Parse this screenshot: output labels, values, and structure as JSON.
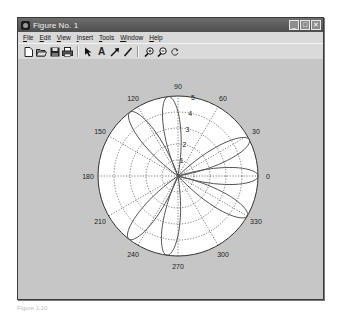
{
  "window": {
    "title": "Figure No. 1",
    "controls": {
      "minimize": "_",
      "maximize": "□",
      "close": "✕"
    }
  },
  "menubar": {
    "items": [
      {
        "label": "File",
        "underline": "F"
      },
      {
        "label": "Edit",
        "underline": "E"
      },
      {
        "label": "View",
        "underline": "V"
      },
      {
        "label": "Insert",
        "underline": "I"
      },
      {
        "label": "Tools",
        "underline": "T"
      },
      {
        "label": "Window",
        "underline": "W"
      },
      {
        "label": "Help",
        "underline": "H"
      }
    ]
  },
  "toolbar": {
    "buttons": [
      {
        "name": "new-figure",
        "icon": "new-file-icon",
        "glyph": "🗋"
      },
      {
        "name": "open-file",
        "icon": "open-folder-icon",
        "glyph": "📂"
      },
      {
        "name": "save",
        "icon": "save-icon",
        "glyph": "💾"
      },
      {
        "name": "print",
        "icon": "print-icon",
        "glyph": "🖶"
      },
      {
        "name": "edit-plot",
        "icon": "pointer-arrow-icon",
        "glyph": "➷"
      },
      {
        "name": "insert-text",
        "icon": "text-icon",
        "glyph": "A"
      },
      {
        "name": "insert-arrow",
        "icon": "arrow-icon",
        "glyph": "↗"
      },
      {
        "name": "insert-line",
        "icon": "line-icon",
        "glyph": "/"
      },
      {
        "name": "zoom-in",
        "icon": "zoom-in-icon",
        "glyph": "⊕"
      },
      {
        "name": "zoom-out",
        "icon": "zoom-out-icon",
        "glyph": "⊖"
      },
      {
        "name": "rotate-3d",
        "icon": "rotate-icon",
        "glyph": "↻"
      }
    ]
  },
  "chart_data": {
    "type": "polar",
    "title": "",
    "radial_ticks": [
      "1",
      "2",
      "3",
      "4",
      "5"
    ],
    "rlim": [
      0,
      5
    ],
    "angle_ticks": [
      "0",
      "30",
      "60",
      "90",
      "120",
      "150",
      "180",
      "210",
      "240",
      "270",
      "300",
      "330"
    ],
    "grid": true,
    "series": [
      {
        "name": "lobes",
        "lobes": [
          {
            "angle_deg": 0,
            "r_max": 5
          },
          {
            "angle_deg": 27,
            "r_max": 5
          },
          {
            "angle_deg": 97,
            "r_max": 5
          },
          {
            "angle_deg": 127,
            "r_max": 5
          },
          {
            "angle_deg": 232,
            "r_max": 5
          },
          {
            "angle_deg": 262,
            "r_max": 5
          },
          {
            "angle_deg": 330,
            "r_max": 5
          }
        ]
      }
    ]
  },
  "caption": "Figure 1.10"
}
